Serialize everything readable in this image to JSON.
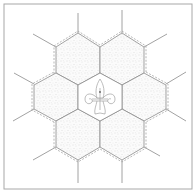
{
  "diagram": {
    "type": "quilt-block",
    "colors": {
      "background": "#ffffff",
      "border": "#a8a8a8",
      "seam_line": "#8a8a8a",
      "dashed_line": "#9a9a9a",
      "stipple": "#c4c4c4",
      "motif": "#a0a0a0"
    },
    "hexagons": [
      {
        "id": "center",
        "shaded": false,
        "motif": "fleur-de-lis"
      },
      {
        "id": "upper-left",
        "shaded": true
      },
      {
        "id": "upper-right",
        "shaded": true
      },
      {
        "id": "left",
        "shaded": true
      },
      {
        "id": "right",
        "shaded": true
      },
      {
        "id": "lower-left",
        "shaded": true
      },
      {
        "id": "lower-right",
        "shaded": true
      }
    ]
  }
}
